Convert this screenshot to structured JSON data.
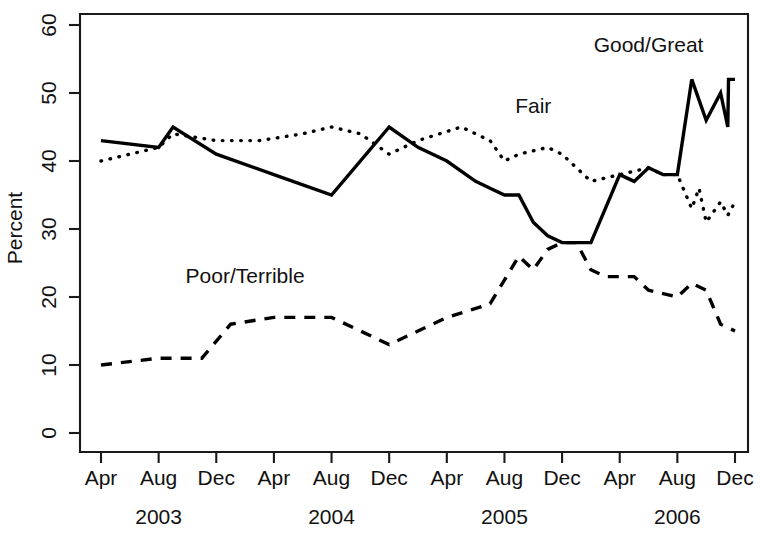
{
  "chart_data": {
    "type": "line",
    "title": "",
    "xlabel": "",
    "ylabel": "Percent",
    "ylim": [
      0,
      62
    ],
    "yticks": [
      0,
      10,
      20,
      30,
      40,
      50,
      60
    ],
    "grid": false,
    "legend_position": "inline-annotations",
    "x_tick_labels": [
      "Apr",
      "Aug",
      "Dec",
      "Apr",
      "Aug",
      "Dec",
      "Apr",
      "Aug",
      "Dec",
      "Apr",
      "Aug",
      "Dec"
    ],
    "year_groups": [
      {
        "label": "2003",
        "center_tick_index": 1
      },
      {
        "label": "2004",
        "center_tick_index": 4
      },
      {
        "label": "2005",
        "center_tick_index": 7
      },
      {
        "label": "2006",
        "center_tick_index": 10
      }
    ],
    "x_months": [
      "2003-04",
      "2003-05",
      "2003-06",
      "2003-07",
      "2003-08",
      "2003-09",
      "2003-10",
      "2003-11",
      "2003-12",
      "2004-01",
      "2004-02",
      "2004-03",
      "2004-04",
      "2004-05",
      "2004-06",
      "2004-07",
      "2004-08",
      "2004-09",
      "2004-10",
      "2004-11",
      "2004-12",
      "2005-01",
      "2005-02",
      "2005-03",
      "2005-04",
      "2005-05",
      "2005-06",
      "2005-07",
      "2005-08",
      "2005-09",
      "2005-10",
      "2005-11",
      "2005-12",
      "2006-01",
      "2006-02",
      "2006-03",
      "2006-04",
      "2006-05",
      "2006-06",
      "2006-07",
      "2006-08",
      "2006-09",
      "2006-10",
      "2006-11",
      "2006-12"
    ],
    "series": [
      {
        "name": "Good/Great",
        "style": "solid",
        "label": "Good/Great",
        "label_x_month": "2006-06",
        "label_y": 56,
        "points": [
          {
            "x": "2003-04",
            "y": 43
          },
          {
            "x": "2003-08",
            "y": 42
          },
          {
            "x": "2003-09",
            "y": 45
          },
          {
            "x": "2003-12",
            "y": 41
          },
          {
            "x": "2004-04",
            "y": 38
          },
          {
            "x": "2004-08",
            "y": 35
          },
          {
            "x": "2004-12",
            "y": 45
          },
          {
            "x": "2005-02",
            "y": 42
          },
          {
            "x": "2005-04",
            "y": 40
          },
          {
            "x": "2005-06",
            "y": 37
          },
          {
            "x": "2005-07",
            "y": 36
          },
          {
            "x": "2005-08",
            "y": 35
          },
          {
            "x": "2005-09",
            "y": 35
          },
          {
            "x": "2005-10",
            "y": 31
          },
          {
            "x": "2005-11",
            "y": 29
          },
          {
            "x": "2005-12",
            "y": 28
          },
          {
            "x": "2006-01",
            "y": 28
          },
          {
            "x": "2006-02",
            "y": 28
          },
          {
            "x": "2006-03",
            "y": 33
          },
          {
            "x": "2006-04",
            "y": 38
          },
          {
            "x": "2006-05",
            "y": 37
          },
          {
            "x": "2006-06",
            "y": 39
          },
          {
            "x": "2006-07",
            "y": 38
          },
          {
            "x": "2006-08",
            "y": 38
          },
          {
            "x": "2006-09",
            "y": 52
          },
          {
            "x": "2006-10",
            "y": 46
          },
          {
            "x": "2006-11",
            "y": 50
          },
          {
            "x": "2006-11b",
            "y": 45
          },
          {
            "x": "2006-12a",
            "y": 52
          },
          {
            "x": "2006-12",
            "y": 52
          }
        ]
      },
      {
        "name": "Fair",
        "style": "dotted",
        "label": "Fair",
        "label_x_month": "2005-10",
        "label_y": 47,
        "points": [
          {
            "x": "2003-04",
            "y": 40
          },
          {
            "x": "2003-06",
            "y": 41
          },
          {
            "x": "2003-08",
            "y": 42
          },
          {
            "x": "2003-09",
            "y": 44
          },
          {
            "x": "2003-12",
            "y": 43
          },
          {
            "x": "2004-03",
            "y": 43
          },
          {
            "x": "2004-06",
            "y": 44
          },
          {
            "x": "2004-08",
            "y": 45
          },
          {
            "x": "2004-10",
            "y": 44
          },
          {
            "x": "2004-12",
            "y": 41
          },
          {
            "x": "2005-02",
            "y": 43
          },
          {
            "x": "2005-05",
            "y": 45
          },
          {
            "x": "2005-07",
            "y": 43
          },
          {
            "x": "2005-08",
            "y": 40
          },
          {
            "x": "2005-09",
            "y": 41
          },
          {
            "x": "2005-11",
            "y": 42
          },
          {
            "x": "2005-12",
            "y": 41
          },
          {
            "x": "2006-01",
            "y": 39
          },
          {
            "x": "2006-02",
            "y": 37
          },
          {
            "x": "2006-04",
            "y": 38
          },
          {
            "x": "2006-06",
            "y": 39
          },
          {
            "x": "2006-07",
            "y": 38
          },
          {
            "x": "2006-08",
            "y": 38
          },
          {
            "x": "2006-09",
            "y": 33
          },
          {
            "x": "2006-09b",
            "y": 36
          },
          {
            "x": "2006-10",
            "y": 31
          },
          {
            "x": "2006-11",
            "y": 34
          },
          {
            "x": "2006-11b",
            "y": 32
          },
          {
            "x": "2006-12",
            "y": 34
          }
        ]
      },
      {
        "name": "Poor/Terrible",
        "style": "dashed",
        "label": "Poor/Terrible",
        "label_x_month": "2004-02",
        "label_y": 22,
        "points": [
          {
            "x": "2003-04",
            "y": 10
          },
          {
            "x": "2003-08",
            "y": 11
          },
          {
            "x": "2003-11",
            "y": 11
          },
          {
            "x": "2004-01",
            "y": 16
          },
          {
            "x": "2004-04",
            "y": 17
          },
          {
            "x": "2004-08",
            "y": 17
          },
          {
            "x": "2004-10",
            "y": 15
          },
          {
            "x": "2004-12",
            "y": 13
          },
          {
            "x": "2005-04",
            "y": 17
          },
          {
            "x": "2005-07",
            "y": 19
          },
          {
            "x": "2005-09",
            "y": 26
          },
          {
            "x": "2005-10",
            "y": 24
          },
          {
            "x": "2005-11",
            "y": 27
          },
          {
            "x": "2005-12",
            "y": 28
          },
          {
            "x": "2006-01",
            "y": 28
          },
          {
            "x": "2006-02",
            "y": 24
          },
          {
            "x": "2006-03",
            "y": 23
          },
          {
            "x": "2006-05",
            "y": 23
          },
          {
            "x": "2006-06",
            "y": 21
          },
          {
            "x": "2006-08",
            "y": 20
          },
          {
            "x": "2006-09",
            "y": 22
          },
          {
            "x": "2006-10",
            "y": 21
          },
          {
            "x": "2006-11",
            "y": 16
          },
          {
            "x": "2006-12",
            "y": 15
          }
        ]
      }
    ]
  },
  "axes": {
    "y_title": "Percent",
    "y_tick_labels": [
      "0",
      "10",
      "20",
      "30",
      "40",
      "50",
      "60"
    ],
    "x_tick_labels": [
      "Apr",
      "Aug",
      "Dec",
      "Apr",
      "Aug",
      "Dec",
      "Apr",
      "Aug",
      "Dec",
      "Apr",
      "Aug",
      "Dec"
    ],
    "year_labels": [
      "2003",
      "2004",
      "2005",
      "2006"
    ]
  },
  "annotations": {
    "good_great": "Good/Great",
    "fair": "Fair",
    "poor_terrible": "Poor/Terrible"
  },
  "colors": {
    "ink": "#000000",
    "background": "#ffffff"
  }
}
